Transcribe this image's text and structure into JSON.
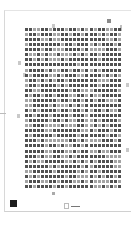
{
  "document": {
    "type": "scanned-page",
    "language": "Chinese (classical text, illegible at thumbnail scale)",
    "text_grid": {
      "rows": 32,
      "columns": 24
    },
    "footer_label": "□ ——",
    "colors": {
      "background": "#ffffff",
      "text": "#333333",
      "frame": "#d8d8d8",
      "logo": "#1d1d1d"
    }
  }
}
